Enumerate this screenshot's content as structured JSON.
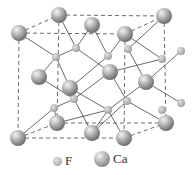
{
  "diagram": {
    "legend": [
      {
        "symbol": "F",
        "label": "F",
        "kind": "small-sphere"
      },
      {
        "symbol": "Ca",
        "label": "Ca",
        "kind": "large-sphere"
      }
    ],
    "colors": {
      "sphere_light": "#f0f0f0",
      "sphere_dark": "#7a7a7a",
      "bond": "#444444",
      "cell_edge": "#444444"
    }
  }
}
